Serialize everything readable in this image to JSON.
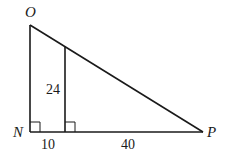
{
  "diagram": {
    "type": "right-triangle-similar",
    "colors": {
      "stroke": "#1a1a1a",
      "background": "#ffffff"
    },
    "vertices": {
      "O": {
        "label": "O",
        "x": 30,
        "y": 25
      },
      "N": {
        "label": "N",
        "x": 30,
        "y": 132
      },
      "P": {
        "label": "P",
        "x": 203,
        "y": 132
      }
    },
    "inner_segment": {
      "x": 65,
      "y_top": 46,
      "y_bottom": 132
    },
    "labels": {
      "O": "O",
      "N": "N",
      "P": "P",
      "inner_height": "24",
      "left_base": "10",
      "right_base": "40"
    },
    "right_angle_marks": [
      "N",
      "inner-foot"
    ]
  }
}
